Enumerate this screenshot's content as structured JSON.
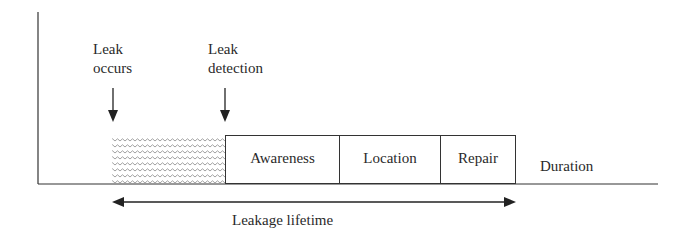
{
  "diagram": {
    "markers": [
      {
        "line1": "Leak",
        "line2": "occurs"
      },
      {
        "line1": "Leak",
        "line2": "detection"
      }
    ],
    "phases": [
      {
        "label": "",
        "type": "hatched"
      },
      {
        "label": "Awareness"
      },
      {
        "label": "Location"
      },
      {
        "label": "Repair"
      }
    ],
    "x_axis_label": "Duration",
    "span_label": "Leakage lifetime"
  }
}
